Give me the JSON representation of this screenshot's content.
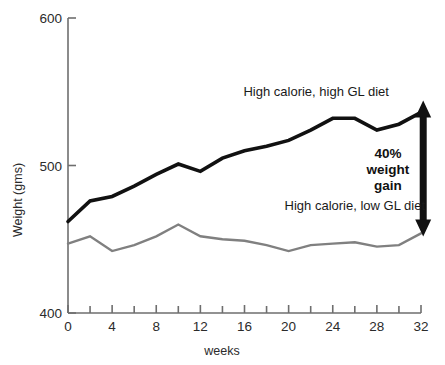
{
  "chart_data": {
    "type": "line",
    "title": "",
    "xlabel": "weeks",
    "ylabel": "Weight (gms)",
    "xlim": [
      0,
      32
    ],
    "ylim": [
      400,
      600
    ],
    "grid": false,
    "legend_position": "inline-annotation",
    "x_ticks_major": [
      0,
      4,
      8,
      12,
      16,
      20,
      24,
      28,
      32
    ],
    "x_ticks_minor": [
      2,
      6,
      10,
      14,
      18,
      22,
      26,
      30
    ],
    "x_tick_labels": [
      "0",
      "4",
      "8",
      "12",
      "16",
      "20",
      "24",
      "28",
      "32"
    ],
    "y_ticks": [
      400,
      500,
      600
    ],
    "y_tick_labels": [
      "400",
      "500",
      "600"
    ],
    "x": [
      0,
      2,
      4,
      6,
      8,
      10,
      12,
      14,
      16,
      18,
      20,
      22,
      24,
      26,
      28,
      30,
      32
    ],
    "series": [
      {
        "name": "High calorie, high GL diet",
        "color": "#111111",
        "values": [
          462,
          476,
          479,
          486,
          494,
          501,
          496,
          505,
          510,
          513,
          517,
          524,
          532,
          532,
          524,
          528,
          536
        ]
      },
      {
        "name": "High calorie, low GL diet",
        "color": "#808080",
        "values": [
          447,
          452,
          442,
          446,
          452,
          460,
          452,
          450,
          449,
          446,
          442,
          446,
          447,
          448,
          445,
          446,
          454
        ]
      }
    ],
    "annotations": [
      {
        "id": "high-gl-series-label",
        "text": "High calorie, high GL diet",
        "x": 22.5,
        "y": 547
      },
      {
        "id": "low-gl-series-label",
        "text": "High calorie, low GL diet",
        "x": 26.0,
        "y": 470
      },
      {
        "id": "weight-gain-arrow-label",
        "lines": [
          "40%",
          "weight",
          "gain"
        ],
        "x": 29.0,
        "y": 505
      }
    ],
    "arrow": {
      "id": "weight-gain-arrow",
      "label": "40% weight gain",
      "x": 32.2,
      "y_top": 540,
      "y_bottom": 456,
      "color": "#111111",
      "double_headed": true
    }
  },
  "axis": {
    "y_title": "Weight (gms)",
    "x_title": "weeks"
  }
}
